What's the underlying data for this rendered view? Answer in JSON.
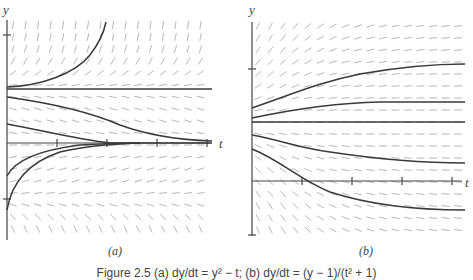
{
  "figure": {
    "caption": "Figure 2.5 (a) dy/dt = y² − t; (b) dy/dt = (y − 1)/(t² + 1)",
    "panel_a": {
      "label": "(a)",
      "x_axis_label": "t",
      "y_axis_label": "y"
    },
    "panel_b": {
      "label": "(b)",
      "x_axis_label": "t",
      "y_axis_label": "y"
    }
  },
  "chart_data": [
    {
      "type": "line",
      "title": "(a) slope field with solution curves",
      "xlabel": "t",
      "ylabel": "y",
      "x_ticks": 4,
      "y_ticks": 2,
      "grid": false,
      "series": [
        {
          "name": "equilibrium",
          "points": [
            [
              0,
              1
            ],
            [
              4,
              1
            ]
          ]
        },
        {
          "name": "blowup",
          "points": [
            [
              0,
              1.05
            ],
            [
              1,
              1.6
            ],
            [
              1.7,
              2.3
            ],
            [
              2,
              2.6
            ]
          ]
        },
        {
          "name": "decay-1",
          "points": [
            [
              0,
              0.85
            ],
            [
              1,
              0.7
            ],
            [
              2,
              0.4
            ],
            [
              3,
              0.12
            ],
            [
              4,
              0.03
            ]
          ]
        },
        {
          "name": "decay-2",
          "points": [
            [
              0,
              0.4
            ],
            [
              1,
              0.18
            ],
            [
              2,
              0.03
            ],
            [
              3,
              0
            ],
            [
              4,
              0
            ]
          ]
        },
        {
          "name": "rise-1",
          "points": [
            [
              0,
              -0.6
            ],
            [
              0.5,
              -0.25
            ],
            [
              1,
              -0.12
            ],
            [
              2,
              -0.02
            ],
            [
              3,
              0
            ]
          ]
        },
        {
          "name": "rise-2",
          "points": [
            [
              0,
              -1.2
            ],
            [
              0.2,
              -0.7
            ],
            [
              0.6,
              -0.35
            ],
            [
              1,
              -0.2
            ],
            [
              2,
              -0.04
            ],
            [
              3,
              0
            ]
          ]
        }
      ]
    },
    {
      "type": "line",
      "title": "(b) slope field with solution curves",
      "xlabel": "t",
      "ylabel": "y",
      "x_ticks": 4,
      "y_ticks": 2,
      "grid": false,
      "series": [
        {
          "name": "equilibrium",
          "points": [
            [
              0,
              1
            ],
            [
              4.2,
              1
            ]
          ]
        },
        {
          "name": "upper-1",
          "points": [
            [
              0,
              1.2
            ],
            [
              1,
              1.6
            ],
            [
              2,
              1.85
            ],
            [
              3,
              1.98
            ],
            [
              4.2,
              2.0
            ]
          ]
        },
        {
          "name": "upper-2",
          "points": [
            [
              0,
              1.06
            ],
            [
              1,
              1.2
            ],
            [
              2,
              1.28
            ],
            [
              3,
              1.3
            ],
            [
              4.2,
              1.3
            ]
          ]
        },
        {
          "name": "lower-1",
          "points": [
            [
              0,
              0.8
            ],
            [
              1,
              0.6
            ],
            [
              2,
              0.45
            ],
            [
              3,
              0.38
            ],
            [
              4.2,
              0.36
            ]
          ]
        },
        {
          "name": "lower-2",
          "points": [
            [
              0,
              0.57
            ],
            [
              1,
              0.0
            ],
            [
              1.5,
              -0.2
            ],
            [
              2,
              -0.5
            ],
            [
              3,
              -0.8
            ],
            [
              4.2,
              -0.9
            ]
          ]
        }
      ]
    }
  ]
}
